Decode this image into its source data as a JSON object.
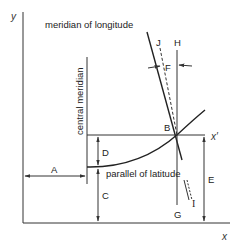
{
  "diagram": {
    "axes": {
      "x_label": "x",
      "y_label": "y",
      "x_prime_label": "x′"
    },
    "labels": {
      "meridian": "meridian of longitude",
      "parallel": "parallel of latitude",
      "central_meridian": "central meridian",
      "A": "A",
      "B": "B",
      "C": "C",
      "D": "D",
      "E": "E",
      "F": "F",
      "G": "G",
      "H": "H",
      "I": "I",
      "J": "J"
    },
    "colors": {
      "line": "#333333",
      "text": "#222222",
      "background": "#ffffff"
    }
  }
}
